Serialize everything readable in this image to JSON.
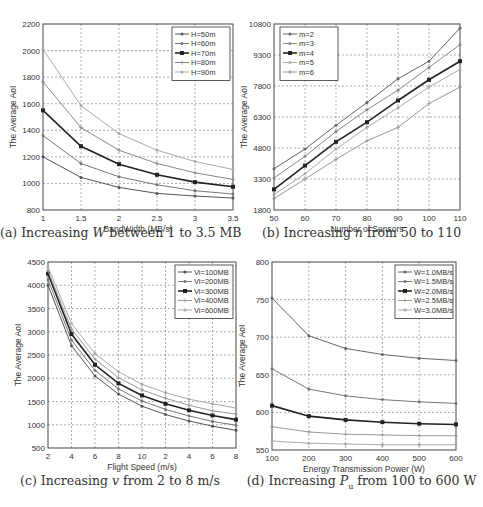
{
  "figure": {
    "captions": [
      {
        "prefix": "(a) Increasing ",
        "var": "W",
        "suffix": " between 1 to 3.5 MB"
      },
      {
        "prefix": "(b) Increasing ",
        "var": "n",
        "suffix": " from 50 to 110"
      },
      {
        "prefix": "(c) Increasing ",
        "var": "v",
        "suffix": " from 2 to 8 m/s"
      },
      {
        "prefix": "(d) Increasing ",
        "var": "P",
        "sub": "u",
        "suffix": " from 100 to 600 W"
      }
    ]
  },
  "chart_data": [
    {
      "id": "a",
      "type": "line",
      "title": "(a) Increasing W between 1 to 3.5 MB",
      "xlabel": "BandWidth (MB/s)",
      "ylabel": "The Average AoI",
      "x": [
        1,
        1.5,
        2,
        2.5,
        3,
        3.5
      ],
      "xticks": [
        "1",
        "1.5",
        "2",
        "2.5",
        "3",
        "3.5"
      ],
      "xlim": [
        1,
        3.5
      ],
      "yticks": [
        "800",
        "1000",
        "1200",
        "1400",
        "1600",
        "1800",
        "2000",
        "2200"
      ],
      "ylim": [
        800,
        2200
      ],
      "grid": true,
      "legend_position": "upper right",
      "series": [
        {
          "name": "H=50m",
          "values": [
            1200,
            1045,
            970,
            925,
            905,
            890
          ],
          "color": "#555555",
          "width": 1,
          "marker": "dot"
        },
        {
          "name": "H=60m",
          "values": [
            1360,
            1150,
            1050,
            990,
            945,
            920
          ],
          "color": "#777777",
          "width": 1,
          "marker": "dot"
        },
        {
          "name": "H=70m",
          "values": [
            1550,
            1280,
            1145,
            1065,
            1010,
            975
          ],
          "color": "#222222",
          "width": 1.6,
          "marker": "square"
        },
        {
          "name": "H=80m",
          "values": [
            1765,
            1420,
            1250,
            1150,
            1080,
            1030
          ],
          "color": "#888888",
          "width": 1,
          "marker": "plus"
        },
        {
          "name": "H=90m",
          "values": [
            2010,
            1585,
            1375,
            1250,
            1165,
            1105
          ],
          "color": "#aaaaaa",
          "width": 1,
          "marker": "dot"
        }
      ]
    },
    {
      "id": "b",
      "type": "line",
      "title": "(b) Increasing n from 50 to 110",
      "xlabel": "Number of Sensors",
      "ylabel": "The Average AoI",
      "x": [
        50,
        60,
        70,
        80,
        90,
        100,
        110
      ],
      "xticks": [
        "50",
        "60",
        "70",
        "80",
        "90",
        "100",
        "110"
      ],
      "xlim": [
        50,
        110
      ],
      "yticks": [
        "1800",
        "3300",
        "4800",
        "6300",
        "7800",
        "9300",
        "10800"
      ],
      "ylim": [
        1800,
        10800
      ],
      "grid": true,
      "legend_position": "upper left",
      "series": [
        {
          "name": "m=2",
          "values": [
            3800,
            4750,
            5900,
            7000,
            8150,
            9000,
            10600
          ],
          "color": "#666666",
          "width": 1,
          "marker": "dot"
        },
        {
          "name": "m=3",
          "values": [
            3350,
            4400,
            5600,
            6650,
            7600,
            8700,
            9800
          ],
          "color": "#888888",
          "width": 1,
          "marker": "dot"
        },
        {
          "name": "m=4",
          "values": [
            2800,
            3950,
            5100,
            6050,
            7100,
            8100,
            9000
          ],
          "color": "#222222",
          "width": 1.6,
          "marker": "square"
        },
        {
          "name": "m=5",
          "values": [
            2550,
            3550,
            4750,
            5800,
            6750,
            7750,
            8600
          ],
          "color": "#aaaaaa",
          "width": 1,
          "marker": "dot"
        },
        {
          "name": "m=6",
          "values": [
            2350,
            3300,
            4250,
            5150,
            5800,
            6950,
            7750
          ],
          "color": "#999999",
          "width": 1,
          "marker": "plus"
        }
      ]
    },
    {
      "id": "c",
      "type": "line",
      "title": "(c) Increasing v from 2 to 8 m/s",
      "xlabel": "Flight Speed (m/s)",
      "ylabel": "The Average AoI",
      "x": [
        1,
        2,
        3,
        4,
        5,
        6,
        7,
        8,
        9
      ],
      "xticks": [
        "2",
        "4",
        "6",
        "8",
        "10",
        "2",
        "4",
        "6",
        "8"
      ],
      "xlim": [
        1,
        9
      ],
      "yticks": [
        "500",
        "1000",
        "1500",
        "2000",
        "2500",
        "3000",
        "3500",
        "4000",
        "4500"
      ],
      "ylim": [
        500,
        4500
      ],
      "grid": true,
      "legend_position": "upper right",
      "series": [
        {
          "name": "Vi=100MB",
          "values": [
            4000,
            2700,
            2050,
            1660,
            1400,
            1220,
            1080,
            970,
            880
          ],
          "color": "#555555",
          "width": 1,
          "marker": "dot"
        },
        {
          "name": "Vi=200MB",
          "values": [
            4120,
            2820,
            2170,
            1770,
            1510,
            1330,
            1190,
            1070,
            990
          ],
          "color": "#777777",
          "width": 1,
          "marker": "dot"
        },
        {
          "name": "Vi=300MB",
          "values": [
            4250,
            2950,
            2290,
            1890,
            1630,
            1450,
            1310,
            1200,
            1110
          ],
          "color": "#222222",
          "width": 1.6,
          "marker": "square"
        },
        {
          "name": "Vi=400MB",
          "values": [
            4310,
            3060,
            2410,
            2010,
            1750,
            1570,
            1420,
            1300,
            1230
          ],
          "color": "#999999",
          "width": 1,
          "marker": "plus"
        },
        {
          "name": "Vi=600MB",
          "values": [
            4390,
            3180,
            2530,
            2140,
            1870,
            1690,
            1550,
            1450,
            1360
          ],
          "color": "#aaaaaa",
          "width": 1,
          "marker": "dot"
        }
      ]
    },
    {
      "id": "d",
      "type": "line",
      "title": "(d) Increasing Pu from 100 to 600 W",
      "xlabel": "Energy Transmission Power (W)",
      "ylabel": "The Average AoI",
      "x": [
        100,
        200,
        300,
        400,
        500,
        600
      ],
      "xticks": [
        "100",
        "200",
        "300",
        "400",
        "500",
        "600"
      ],
      "xlim": [
        100,
        600
      ],
      "yticks": [
        "550",
        "600",
        "650",
        "700",
        "750",
        "800"
      ],
      "ylim": [
        550,
        800
      ],
      "grid": true,
      "legend_position": "upper right",
      "series": [
        {
          "name": "W=1.0MB/s",
          "values": [
            752,
            702,
            685,
            677,
            672,
            669
          ],
          "color": "#666666",
          "width": 1,
          "marker": "dot"
        },
        {
          "name": "W=1.5MB/s",
          "values": [
            658,
            631,
            622,
            617,
            614,
            612
          ],
          "color": "#777777",
          "width": 1,
          "marker": "dot"
        },
        {
          "name": "W=2.0MB/s",
          "values": [
            609,
            595,
            590,
            587,
            585,
            584
          ],
          "color": "#222222",
          "width": 1.6,
          "marker": "square"
        },
        {
          "name": "W=2.5MB/s",
          "values": [
            581,
            574,
            571,
            570,
            569,
            569
          ],
          "color": "#999999",
          "width": 1,
          "marker": "plus"
        },
        {
          "name": "W=3.0MB/s",
          "values": [
            562,
            559,
            558,
            557,
            557,
            557
          ],
          "color": "#aaaaaa",
          "width": 1,
          "marker": "dot"
        }
      ]
    }
  ]
}
